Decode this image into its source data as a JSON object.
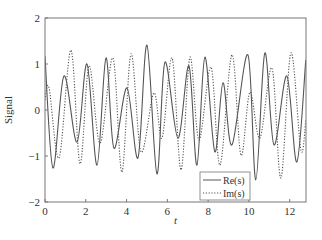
{
  "chart_data": {
    "type": "line",
    "title": "",
    "xlabel": "t",
    "ylabel": "Signal",
    "xlim": [
      0,
      12.8
    ],
    "ylim": [
      -2,
      2
    ],
    "xticks": [
      0,
      2,
      4,
      6,
      8,
      10,
      12
    ],
    "yticks": [
      -2,
      -1,
      0,
      1,
      2
    ],
    "grid": false,
    "legend_position": "lower right",
    "series": [
      {
        "name": "Re(s)",
        "style": "solid",
        "color": "#555555",
        "points": [
          [
            0.0,
            1.17
          ],
          [
            0.39,
            -1.26
          ],
          [
            0.93,
            0.74
          ],
          [
            1.57,
            -0.7
          ],
          [
            2.06,
            1.0
          ],
          [
            2.55,
            -1.2
          ],
          [
            2.99,
            1.13
          ],
          [
            3.38,
            -0.83
          ],
          [
            4.02,
            0.48
          ],
          [
            4.56,
            -1.04
          ],
          [
            5.0,
            1.41
          ],
          [
            5.49,
            -1.39
          ],
          [
            5.88,
            1.04
          ],
          [
            6.52,
            -0.61
          ],
          [
            7.06,
            0.96
          ],
          [
            7.45,
            -1.2
          ],
          [
            7.84,
            1.15
          ],
          [
            8.33,
            -0.91
          ],
          [
            8.73,
            0.59
          ],
          [
            9.17,
            -0.76
          ],
          [
            9.95,
            1.2
          ],
          [
            10.34,
            -1.52
          ],
          [
            10.78,
            1.24
          ],
          [
            11.23,
            -0.76
          ],
          [
            11.86,
            0.74
          ],
          [
            12.35,
            -1.13
          ],
          [
            12.79,
            1.09
          ]
        ]
      },
      {
        "name": "Im(s)",
        "style": "dotted",
        "color": "#555555",
        "points": [
          [
            0.0,
            0.22
          ],
          [
            0.2,
            0.48
          ],
          [
            0.69,
            -1.04
          ],
          [
            1.27,
            1.3
          ],
          [
            1.72,
            -1.17
          ],
          [
            2.16,
            0.96
          ],
          [
            2.7,
            -0.72
          ],
          [
            3.33,
            1.13
          ],
          [
            3.77,
            -1.35
          ],
          [
            4.22,
            1.22
          ],
          [
            4.71,
            -0.91
          ],
          [
            5.34,
            0.37
          ],
          [
            5.74,
            -0.61
          ],
          [
            6.23,
            1.13
          ],
          [
            6.67,
            -1.3
          ],
          [
            7.11,
            1.15
          ],
          [
            7.55,
            -0.65
          ],
          [
            8.14,
            0.93
          ],
          [
            8.58,
            -1.2
          ],
          [
            9.17,
            1.2
          ],
          [
            9.61,
            -0.98
          ],
          [
            10.05,
            0.39
          ],
          [
            10.54,
            -0.61
          ],
          [
            11.13,
            0.91
          ],
          [
            11.57,
            -1.48
          ],
          [
            12.06,
            1.24
          ],
          [
            12.55,
            -0.87
          ],
          [
            12.79,
            -0.22
          ]
        ]
      }
    ]
  },
  "legend": {
    "re_label": "Re(s)",
    "im_label": "Im(s)"
  },
  "axes": {
    "xlabel": "t",
    "ylabel": "Signal"
  }
}
